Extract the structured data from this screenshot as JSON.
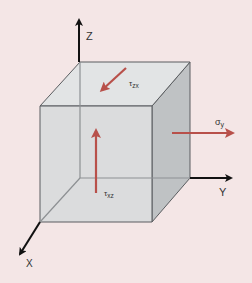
{
  "diagram": {
    "axes": {
      "z_label": "Z",
      "y_label": "Y",
      "x_label": "X"
    },
    "stresses": {
      "tau_zx": {
        "symbol": "τ",
        "subscript": "zx",
        "face": "top",
        "direction": "toward -y/+x (down-left on top face)"
      },
      "tau_xz": {
        "symbol": "τ",
        "subscript": "xz",
        "face": "front",
        "direction": "+z (upward)"
      },
      "sigma_y": {
        "symbol": "σ",
        "subscript": "y",
        "face": "right",
        "direction": "+y (outward)"
      }
    },
    "colors": {
      "background": "#f4e6e6",
      "cube_front": "#d9dcdd",
      "cube_top": "#e3e5e6",
      "cube_right": "#b9bcbe",
      "cube_edge": "#5a5d60",
      "hidden_edge": "#8a8d90",
      "axis": "#111111",
      "stress_arrow": "#b8504a"
    }
  }
}
